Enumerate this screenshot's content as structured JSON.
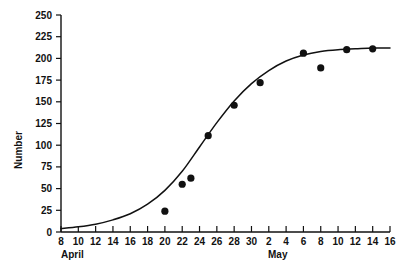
{
  "chart_data": {
    "type": "scatter",
    "title": "",
    "subtitle": "",
    "xlabel": "",
    "ylabel": "Number",
    "xlim": [
      8,
      46
    ],
    "ylim": [
      0,
      250
    ],
    "grid": false,
    "legend": null,
    "x_axis": {
      "months": [
        {
          "name": "April",
          "start_day": 8,
          "end_day": 30
        },
        {
          "name": "May",
          "start_day": 1,
          "end_day": 16
        }
      ],
      "tick_labels": [
        "8",
        "10",
        "12",
        "14",
        "16",
        "18",
        "20",
        "22",
        "24",
        "26",
        "28",
        "30",
        "2",
        "4",
        "6",
        "8",
        "10",
        "12",
        "14",
        "16"
      ],
      "tick_values": [
        8,
        10,
        12,
        14,
        16,
        18,
        20,
        22,
        24,
        26,
        28,
        30,
        32,
        34,
        36,
        38,
        40,
        42,
        44,
        46
      ],
      "tick_interval_days": 2
    },
    "y_axis": {
      "tick_labels": [
        "0",
        "25",
        "50",
        "75",
        "100",
        "125",
        "150",
        "175",
        "200",
        "225",
        "250"
      ],
      "tick_values": [
        0,
        25,
        50,
        75,
        100,
        125,
        150,
        175,
        200,
        225,
        250
      ],
      "tick_interval": 25
    },
    "points": [
      {
        "x": 20,
        "y": 24,
        "date": "April 20"
      },
      {
        "x": 22,
        "y": 55,
        "date": "April 22"
      },
      {
        "x": 23,
        "y": 62,
        "date": "April 23"
      },
      {
        "x": 25,
        "y": 111,
        "date": "April 25"
      },
      {
        "x": 28,
        "y": 146,
        "date": "April 28"
      },
      {
        "x": 31,
        "y": 172,
        "date": "May 1"
      },
      {
        "x": 36,
        "y": 206,
        "date": "May 6"
      },
      {
        "x": 38,
        "y": 189,
        "date": "May 8"
      },
      {
        "x": 41,
        "y": 210,
        "date": "May 11"
      },
      {
        "x": 44,
        "y": 211,
        "date": "May 14"
      }
    ],
    "curve": {
      "description": "fitted logistic (sigmoid) growth curve",
      "x": [
        8,
        10,
        12,
        14,
        16,
        18,
        20,
        22,
        24,
        26,
        28,
        30,
        32,
        34,
        36,
        38,
        40,
        42,
        44,
        46
      ],
      "y": [
        4,
        6,
        9,
        14,
        21,
        32,
        48,
        70,
        98,
        126,
        151,
        171,
        186,
        197,
        204,
        208,
        210,
        211,
        212,
        212
      ]
    },
    "colors": {
      "axis": "#111111",
      "curve": "#111111",
      "marker": "#111111",
      "background": "#ffffff"
    }
  }
}
